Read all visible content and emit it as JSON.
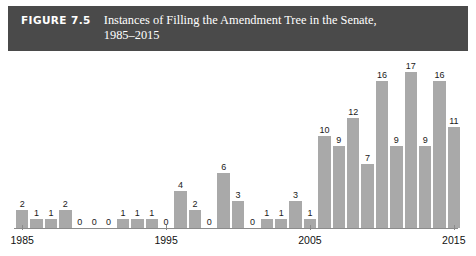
{
  "figure": {
    "label": "FIGURE 7.5",
    "title_line1": "Instances of Filling the Amendment Tree in the Senate,",
    "title_line2": "1985–2015",
    "header_bg": "#4a4a4a",
    "header_text_color": "#ffffff"
  },
  "chart_data": {
    "type": "bar",
    "title": "Instances of Filling the Amendment Tree in the Senate, 1985–2015",
    "xlabel": "",
    "ylabel": "",
    "ylim": [
      0,
      18
    ],
    "grid": false,
    "legend": null,
    "bar_color": "#a9a9a9",
    "axis_color": "#8c8c8c",
    "categories": [
      "1985",
      "1986",
      "1987",
      "1988",
      "1989",
      "1990",
      "1991",
      "1992",
      "1993",
      "1994",
      "1995",
      "1996",
      "1997",
      "1998",
      "1999",
      "2000",
      "2001",
      "2002",
      "2003",
      "2004",
      "2005",
      "2006",
      "2007",
      "2008",
      "2009",
      "2010",
      "2011",
      "2012",
      "2013",
      "2014",
      "2015"
    ],
    "values": [
      2,
      1,
      1,
      2,
      0,
      0,
      0,
      1,
      1,
      1,
      0,
      4,
      2,
      0,
      6,
      3,
      0,
      1,
      1,
      3,
      1,
      10,
      9,
      12,
      7,
      16,
      9,
      17,
      9,
      16,
      11
    ],
    "tick_labels": [
      "1985",
      "1995",
      "2005",
      "2015"
    ],
    "tick_indices": [
      0,
      10,
      20,
      30
    ]
  }
}
